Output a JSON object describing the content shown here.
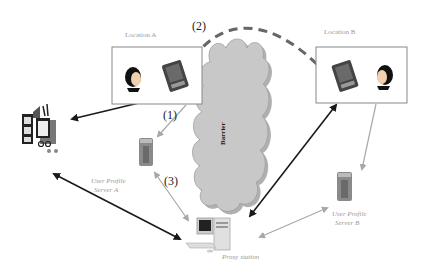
{
  "labels": {
    "location_a": "Location A",
    "location_b": "Location B",
    "barrier": "Barrier",
    "server_a_line1": "User Profile",
    "server_a_line2": "Server A",
    "server_b_line1": "User Profile",
    "server_b_line2": "Server B",
    "proxy": "Proxy station"
  },
  "steps": {
    "step1": "(1)",
    "step2": "(2)",
    "step3": "(3)"
  },
  "colors": {
    "dark_arrow": "#1a1a1a",
    "light_arrow": "#a8a8a8",
    "cloud_fill": "#c8c8c8",
    "dashed": "#666666"
  }
}
